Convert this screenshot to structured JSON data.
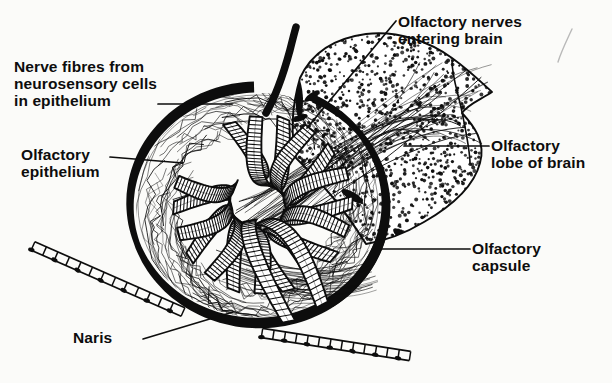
{
  "figure": {
    "domain": "diagram",
    "style": "black-and-white line illustration, stipple and hatch shading",
    "background_color": "#fbfbf9",
    "ink_color": "#0d0d0d"
  },
  "labels": [
    {
      "id": "nerve-fibres",
      "text": "Nerve fibres from\nneurosensory cells\nin epithelium",
      "lines": [
        "Nerve fibres from",
        "neurosensory cells",
        "in epithelium"
      ],
      "align": "left",
      "leader": {
        "from": [
          158,
          104
        ],
        "to": [
          232,
          104
        ]
      }
    },
    {
      "id": "olfactory-epithelium",
      "text": "Olfactory\nepithelium",
      "lines": [
        "Olfactory",
        "epithelium"
      ],
      "align": "left",
      "leader": {
        "from": [
          110,
          157
        ],
        "to": [
          183,
          163
        ]
      }
    },
    {
      "id": "olfactory-nerves-entering-brain",
      "text": "Olfactory nerves\nentering brain",
      "lines": [
        "Olfactory nerves",
        "entering brain"
      ],
      "align": "left",
      "leader": {
        "from": [
          396,
          21
        ],
        "to": [
          307,
          128
        ]
      }
    },
    {
      "id": "olfactory-lobe-of-brain",
      "text": "Olfactory\nlobe of brain",
      "lines": [
        "Olfactory",
        "lobe of brain"
      ],
      "align": "left",
      "leader": {
        "from": [
          489,
          146
        ],
        "to": [
          404,
          146
        ]
      }
    },
    {
      "id": "olfactory-capsule",
      "text": "Olfactory\ncapsule",
      "lines": [
        "Olfactory",
        "capsule"
      ],
      "align": "left",
      "leader": {
        "from": [
          470,
          249
        ],
        "to": [
          382,
          249
        ]
      }
    },
    {
      "id": "naris",
      "text": "Naris",
      "lines": [
        "Naris"
      ],
      "align": "left",
      "leader": {
        "from": [
          143,
          339
        ],
        "to": [
          233,
          312
        ]
      }
    }
  ],
  "structures": [
    {
      "id": "olfactory-capsule-wall",
      "note": "thick black arc enclosing the rosette"
    },
    {
      "id": "olfactory-rosette",
      "note": "radial array of epithelial lamellae with ladder hatching"
    },
    {
      "id": "olfactory-lobe",
      "note": "stippled wedge of brain tissue, upper right"
    },
    {
      "id": "olfactory-nerve-bundles",
      "note": "fibre strands crossing into the lobe"
    },
    {
      "id": "nerve-stalk",
      "note": "thick black stalk rising above capsule"
    },
    {
      "id": "naris-band-upper-left",
      "note": "segmented chain band, lower left"
    },
    {
      "id": "naris-band-lower-right",
      "note": "segmented chain band, lower right"
    },
    {
      "id": "pencil-mark",
      "note": "faint stray pencil stroke, top right"
    }
  ]
}
